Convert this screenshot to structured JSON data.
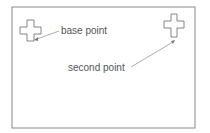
{
  "labels": {
    "base_point": "base point",
    "second_point": "second point"
  },
  "colors": {
    "stroke": "#777777",
    "text": "#555555"
  }
}
